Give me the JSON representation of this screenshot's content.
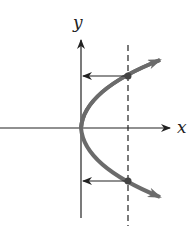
{
  "diagram": {
    "axis_labels": {
      "x": "x",
      "y": "y"
    },
    "curve": {
      "type": "parabola opening right (x = y^2)",
      "color": "#6b6b6b"
    },
    "vertical_line": {
      "style": "dashed",
      "intersections": 2
    },
    "arrows": {
      "description": "horizontal arrows from intersection points pointing to y-axis",
      "count": 2
    },
    "colors": {
      "axes": "#222222",
      "curve": "#6b6b6b",
      "points": "#444444"
    }
  }
}
